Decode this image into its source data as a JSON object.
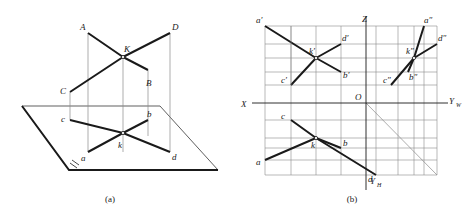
{
  "figure": {
    "caption_a": "(a)",
    "caption_b": "(b)"
  },
  "fig_a": {
    "labels": {
      "A": "A",
      "B": "B",
      "C": "C",
      "D": "D",
      "K": "K",
      "a": "a",
      "b": "b",
      "c": "c",
      "d": "d",
      "k": "k"
    }
  },
  "fig_b": {
    "axes": {
      "X": "X",
      "Z": "Z",
      "YW": "Y",
      "YW_sub": "W",
      "YH": "Y",
      "YH_sub": "H",
      "O": "O"
    },
    "labels": {
      "a_p": "a′",
      "b_p": "b′",
      "c_p": "c′",
      "d_p": "d′",
      "k_p": "k′",
      "a_pp": "a″",
      "b_pp": "b″",
      "c_pp": "c″",
      "d_pp": "d″",
      "k_pp": "k″",
      "a": "a",
      "b": "b",
      "c": "c",
      "d": "d",
      "k": "k"
    }
  },
  "colors": {
    "ink": "#1a1a1a",
    "thin": "#8a8a8a",
    "background": "#ffffff"
  }
}
